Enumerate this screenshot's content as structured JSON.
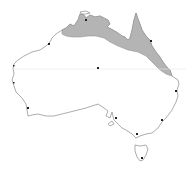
{
  "map": {
    "subject": "Australia distribution map",
    "region_shaded": "Northern Australia coastal range (Kimberley, Top End, Gulf of Carpentaria, Cape York, east Queensland coast)",
    "colors": {
      "background": "#ffffff",
      "land": "#ffffff",
      "coastline": "#8a8a8a",
      "shaded_range": "#b4b4b4",
      "city_marker": "#222222",
      "tropic_line": "#e4e4e4"
    },
    "reference_lines": [
      "Tropic of Capricorn"
    ],
    "city_markers": [
      {
        "name": "Darwin",
        "x": 86,
        "y": 20
      },
      {
        "name": "Broome",
        "x": 49,
        "y": 44
      },
      {
        "name": "Cairns",
        "x": 151,
        "y": 41
      },
      {
        "name": "Alice Springs",
        "x": 98,
        "y": 68
      },
      {
        "name": "Carnarvon",
        "x": 14,
        "y": 66
      },
      {
        "name": "Geraldton",
        "x": 14,
        "y": 83
      },
      {
        "name": "Perth",
        "x": 28,
        "y": 108
      },
      {
        "name": "Brisbane",
        "x": 176,
        "y": 91
      },
      {
        "name": "Adelaide",
        "x": 116,
        "y": 118
      },
      {
        "name": "Sydney",
        "x": 162,
        "y": 120
      },
      {
        "name": "Melbourne",
        "x": 137,
        "y": 134
      },
      {
        "name": "Hobart",
        "x": 142,
        "y": 158
      }
    ]
  }
}
